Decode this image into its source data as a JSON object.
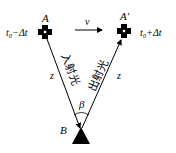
{
  "diagram": {
    "point_a": {
      "label": "A",
      "time": "t₀−Δt"
    },
    "point_a_prime": {
      "label": "A′",
      "time": "t₀+Δt"
    },
    "point_b": {
      "label": "B"
    },
    "velocity": {
      "label": "v"
    },
    "left_distance": {
      "label": "z"
    },
    "right_distance": {
      "label": "z"
    },
    "incident_ray": {
      "label": "入射光"
    },
    "reflected_ray": {
      "label": "出射光"
    },
    "angle": {
      "label": "β"
    },
    "colors": {
      "stroke": "#000000",
      "background": "#ffffff"
    }
  }
}
